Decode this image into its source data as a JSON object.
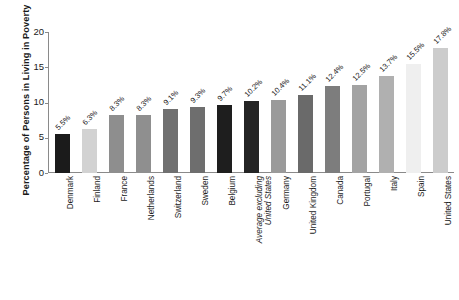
{
  "chart_data": {
    "type": "bar",
    "title": "",
    "xlabel": "",
    "ylabel": "Percentage of Persons in Living in Poverty",
    "ylim": [
      0,
      20
    ],
    "yticks": [
      0,
      5,
      10,
      15,
      20
    ],
    "grid": false,
    "legend": "none",
    "categories": [
      "Denmark",
      "Finland",
      "France",
      "Netherlands",
      "Switzerland",
      "Sweden",
      "Belgium",
      "Average excluding United States",
      "Germany",
      "United Kingdom",
      "Canada",
      "Portugal",
      "Italy",
      "Spain",
      "United States"
    ],
    "values": [
      5.5,
      6.3,
      8.3,
      8.3,
      9.1,
      9.3,
      9.7,
      10.2,
      10.4,
      11.1,
      12.4,
      12.5,
      13.7,
      15.5,
      17.8
    ],
    "value_labels": [
      "5.5%",
      "6.3%",
      "8.3%",
      "8.3%",
      "9.1%",
      "9.3%",
      "9.7%",
      "10.2%",
      "10.4%",
      "11.1%",
      "12.4%",
      "12.5%",
      "13.7%",
      "15.5%",
      "17.8%"
    ],
    "bar_colors": [
      "#1b1b1b",
      "#d2d2d2",
      "#8e8e8e",
      "#8f8f8f",
      "#707070",
      "#6e6e6e",
      "#1e1e1e",
      "#242424",
      "#9a9a9a",
      "#6a6a6a",
      "#7d7d7d",
      "#a3a3a3",
      "#b0b0b0",
      "#efefef",
      "#cccccc"
    ],
    "italic_categories": [
      "Average excluding United States"
    ],
    "category_lines": {
      "Average excluding United States": [
        "Average excluding",
        "United States"
      ]
    }
  },
  "axis": {
    "tick_0": "0",
    "tick_5": "5",
    "tick_10": "10",
    "tick_15": "15",
    "tick_20": "20"
  }
}
